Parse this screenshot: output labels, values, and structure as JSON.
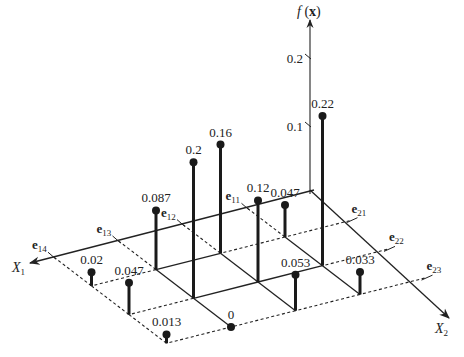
{
  "diagram": {
    "type": "3d-stem-plot",
    "axes": {
      "vertical_label": "f (x)",
      "vertical_label_fn": "f",
      "vertical_label_arg": "x",
      "x1_label": "X",
      "x1_sub": "1",
      "x2_label": "X",
      "x2_sub": "2",
      "vertical_ticks": [
        "0.1",
        "0.2"
      ]
    },
    "x1_points": [
      {
        "base": "e",
        "sub": "11"
      },
      {
        "base": "e",
        "sub": "12"
      },
      {
        "base": "e",
        "sub": "13"
      },
      {
        "base": "e",
        "sub": "14"
      }
    ],
    "x2_points": [
      {
        "base": "e",
        "sub": "21"
      },
      {
        "base": "e",
        "sub": "22"
      },
      {
        "base": "e",
        "sub": "23"
      }
    ]
  },
  "chart_data": {
    "type": "3d-stem",
    "title": "",
    "xlabel": "X1",
    "ylabel": "X2",
    "zlabel": "f(x)",
    "x1_categories": [
      "e11",
      "e12",
      "e13",
      "e14"
    ],
    "x2_categories": [
      "e21",
      "e22",
      "e23"
    ],
    "values": [
      {
        "x1": "e11",
        "x2": "e21",
        "value": 0.047,
        "label": "0.047"
      },
      {
        "x1": "e11",
        "x2": "e22",
        "value": 0.22,
        "label": "0.22"
      },
      {
        "x1": "e11",
        "x2": "e23",
        "value": 0.033,
        "label": "0.033"
      },
      {
        "x1": "e12",
        "x2": "e21",
        "value": 0.16,
        "label": "0.16"
      },
      {
        "x1": "e12",
        "x2": "e22",
        "value": 0.12,
        "label": "0.12"
      },
      {
        "x1": "e12",
        "x2": "e23",
        "value": 0.053,
        "label": "0.053"
      },
      {
        "x1": "e13",
        "x2": "e21",
        "value": 0.087,
        "label": "0.087"
      },
      {
        "x1": "e13",
        "x2": "e22",
        "value": 0.2,
        "label": "0.2"
      },
      {
        "x1": "e13",
        "x2": "e23",
        "value": 0,
        "label": "0"
      },
      {
        "x1": "e14",
        "x2": "e21",
        "value": 0.02,
        "label": "0.02"
      },
      {
        "x1": "e14",
        "x2": "e22",
        "value": 0.047,
        "label": "0.047"
      },
      {
        "x1": "e14",
        "x2": "e23",
        "value": 0.013,
        "label": "0.013"
      }
    ],
    "z_ticks": [
      0.1,
      0.2
    ],
    "zlim": [
      0,
      0.25
    ],
    "grid": true,
    "legend": false
  }
}
